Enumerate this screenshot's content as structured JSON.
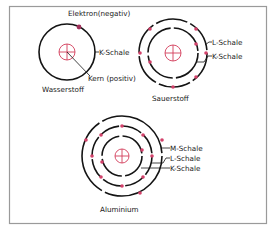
{
  "colors": {
    "shell": "#141414",
    "electron": "#d2416a",
    "nucleus": "#d23c5a",
    "frame": "#9a9a9a",
    "text": "#1a1a1a"
  },
  "atoms": [
    {
      "name": "Wasserstoff",
      "shells": [
        "K-Schale"
      ],
      "electron_count": 1,
      "annotations": {
        "electron": "Elektron(negativ)",
        "shell": "K-Schale",
        "nucleus": "Kern (positiv)"
      }
    },
    {
      "name": "Sauerstoff",
      "shells": [
        "L-Schale",
        "K-Schale"
      ],
      "electron_count": 8
    },
    {
      "name": "Aluminium",
      "shells": [
        "M-Schale",
        "L-Schale",
        "K-Schale"
      ],
      "electron_count": 13
    }
  ]
}
